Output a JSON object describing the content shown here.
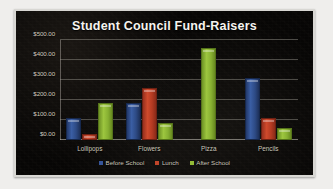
{
  "chart_data": {
    "type": "bar",
    "title": "Student Council Fund-Raisers",
    "xlabel": "",
    "ylabel": "",
    "categories": [
      "Lollipops",
      "Flowers",
      "Pizza",
      "Pencils"
    ],
    "series": [
      {
        "name": "Before School",
        "color": "#36559a",
        "values": [
          100,
          175,
          0,
          300
        ]
      },
      {
        "name": "Lunch",
        "color": "#c2452a",
        "values": [
          20,
          250,
          0,
          100
        ]
      },
      {
        "name": "After School",
        "color": "#93bb37",
        "values": [
          175,
          75,
          450,
          50
        ]
      }
    ],
    "ylim": [
      0,
      500
    ],
    "ytick_values": [
      0,
      100,
      200,
      300,
      400,
      500
    ],
    "ytick_labels": [
      "$0.00",
      "$100.00",
      "$200.00",
      "$300.00",
      "$400.00",
      "$500.00"
    ],
    "grid": true,
    "legend_position": "bottom",
    "background_color": "#070605",
    "text_color": "#cbc6ba",
    "title_color": "#f6f4ef"
  }
}
